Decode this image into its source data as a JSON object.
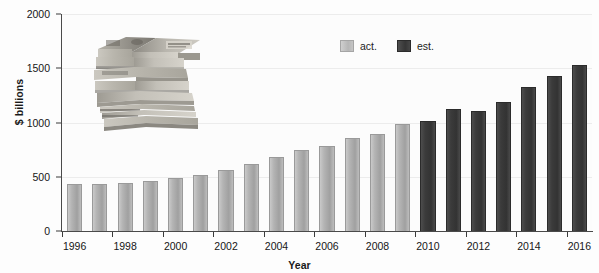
{
  "chart_data": {
    "type": "bar",
    "title": "",
    "subtitle": "",
    "xlabel": "Year",
    "ylabel": "$ billions",
    "categories": [
      1996,
      1997,
      1998,
      1999,
      2000,
      2001,
      2002,
      2003,
      2004,
      2005,
      2006,
      2007,
      2008,
      2009,
      2010,
      2011,
      2012,
      2013,
      2014,
      2015,
      2016
    ],
    "series": [
      {
        "name": "act.",
        "color": "#b0b0b0",
        "values": [
          430,
          435,
          445,
          460,
          490,
          520,
          565,
          620,
          680,
          745,
          780,
          855,
          890,
          985,
          null,
          null,
          null,
          null,
          null,
          null,
          null
        ]
      },
      {
        "name": "est.",
        "color": "#383838",
        "values": [
          null,
          null,
          null,
          null,
          null,
          null,
          null,
          null,
          null,
          null,
          null,
          null,
          null,
          null,
          1015,
          1125,
          1105,
          1190,
          1330,
          1430,
          1530
        ]
      }
    ],
    "ylim": [
      0,
      2000
    ],
    "y_ticks": [
      0,
      500,
      1000,
      1500,
      2000
    ],
    "y_tick_labels": [
      "0",
      "500",
      "1000",
      "1500",
      "2000"
    ],
    "x_tick_years": [
      1996,
      1998,
      2000,
      2002,
      2004,
      2006,
      2008,
      2010,
      2012,
      2014,
      2016
    ],
    "x_tick_labels": [
      "1996",
      "1998",
      "2000",
      "2002",
      "2004",
      "2006",
      "2008",
      "2010",
      "2012",
      "2014",
      "2016"
    ],
    "grid": true,
    "grid_axis": "y",
    "legend_position": "top-center-right",
    "legend": [
      "act.",
      "est."
    ]
  },
  "axes": {
    "y_title": "$ billions",
    "x_title": "Year"
  },
  "legend": {
    "items": [
      {
        "label": "act.",
        "swatch": "light-gray-swatch"
      },
      {
        "label": "est.",
        "swatch": "dark-gray-swatch"
      }
    ]
  },
  "decoration": {
    "photo_name": "stacked-banknote-bundles-photo"
  }
}
